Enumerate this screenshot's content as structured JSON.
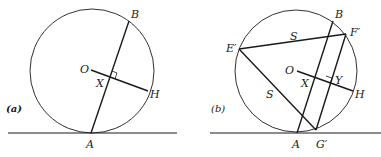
{
  "colors": {
    "ink": "#1a1a1a",
    "background": "#ffffff"
  },
  "figures": [
    {
      "id": "a",
      "caption": "(a)",
      "labels": {
        "B": "B",
        "O": "O",
        "X": "X",
        "H": "H",
        "A": "A"
      }
    },
    {
      "id": "b",
      "caption": "(b)",
      "labels": {
        "B": "B",
        "F": "F′",
        "E": "E′",
        "S1": "S",
        "S2": "S",
        "O": "O",
        "X": "X",
        "Y": "Y",
        "H": "H",
        "A": "A",
        "G": "G′"
      }
    }
  ]
}
